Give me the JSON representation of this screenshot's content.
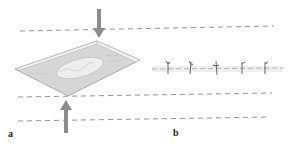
{
  "figure": {
    "panels": [
      {
        "id": "a",
        "label": "a",
        "description": "Perspective view of a sheet with an embedded elongated inclusion, compressed between two planes indicated by opposing arrows"
      },
      {
        "id": "b",
        "label": "b",
        "description": "Side/edge view showing a thin layer along a line with five small branching marks between dashed boundary lines"
      }
    ],
    "colors": {
      "dashed_line": "#7a7a7a",
      "arrow": "#8c8c8c",
      "sheet_edge": "#9a9a9a",
      "sheet_fill": "#d6d6d6",
      "inclusion_fill": "#eeeeee",
      "marks": "#555555"
    },
    "panel_b_mark_count": 5
  }
}
